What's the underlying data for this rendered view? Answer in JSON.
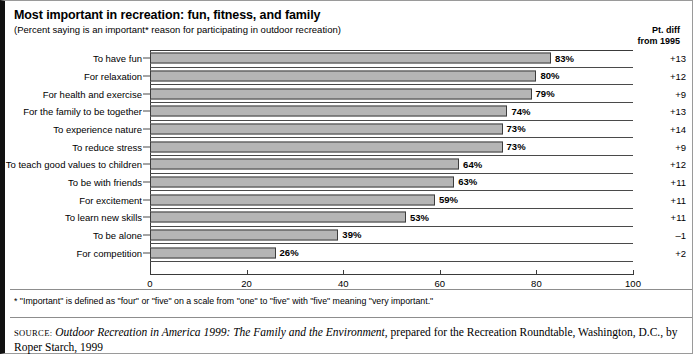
{
  "header": {
    "title": "Most important in recreation: fun, fitness, and family",
    "subtitle": "(Percent saying is an important* reason for participating in outdoor recreation)",
    "diff_header_line1": "Pt. diff",
    "diff_header_line2": "from 1995"
  },
  "footer": {
    "footnote": "* \"Important\" is defined as \"four\" or \"five\" on a scale from \"one\" to \"five\" with \"five\" meaning \"very important.\"",
    "source_keyword": "Source:",
    "source_title": "Outdoor Recreation in America 1999: The Family and the Environment",
    "source_rest": ", prepared for the Recreation Roundtable, Washington, D.C., by Roper Starch, 1999"
  },
  "chart_data": {
    "type": "bar",
    "orientation": "horizontal",
    "title": "Most important in recreation: fun, fitness, and family",
    "subtitle": "(Percent saying is an important* reason for participating in outdoor recreation)",
    "xlabel": "",
    "ylabel": "",
    "xlim": [
      0,
      100
    ],
    "xticks": [
      0,
      20,
      40,
      60,
      80,
      100
    ],
    "xtick_labels": [
      "0",
      "20",
      "40",
      "60",
      "80",
      "100"
    ],
    "grid": false,
    "legend": false,
    "categories": [
      "To have fun",
      "For relaxation",
      "For health and exercise",
      "For the family to be together",
      "To experience nature",
      "To reduce stress",
      "To teach good values to children",
      "To be with friends",
      "For excitement",
      "To learn new skills",
      "To be alone",
      "For competition"
    ],
    "values": [
      83,
      80,
      79,
      74,
      73,
      73,
      64,
      63,
      59,
      53,
      39,
      26
    ],
    "value_labels": [
      "83%",
      "80%",
      "79%",
      "74%",
      "73%",
      "73%",
      "64%",
      "63%",
      "59%",
      "53%",
      "39%",
      "26%"
    ],
    "series": [
      {
        "name": "Percent saying important",
        "values": [
          83,
          80,
          79,
          74,
          73,
          73,
          64,
          63,
          59,
          53,
          39,
          26
        ]
      },
      {
        "name": "Pt. diff from 1995",
        "values": [
          13,
          12,
          9,
          13,
          14,
          9,
          12,
          11,
          11,
          11,
          -1,
          2
        ],
        "labels": [
          "+13",
          "+12",
          "+9",
          "+13",
          "+14",
          "+9",
          "+12",
          "+11",
          "+11",
          "+11",
          "–1",
          "+2"
        ]
      }
    ],
    "bar_color": "#b5b5b5",
    "bar_border_color": "#3d3d3d"
  }
}
